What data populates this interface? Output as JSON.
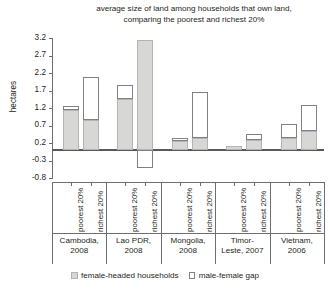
{
  "chart_data": {
    "type": "bar",
    "title": "average size of land among households that own land, comparing the poorest and richest 20%",
    "title_line1": "average size of land among households that own land,",
    "title_line2": "comparing the poorest and richest 20%",
    "xlabel": "",
    "ylabel": "hectares",
    "ylim": [
      -0.8,
      3.2
    ],
    "ytick_step": 0.5,
    "yticks": [
      3.2,
      2.7,
      2.2,
      1.7,
      1.2,
      0.7,
      0.2,
      -0.3,
      -0.8
    ],
    "ytick_labels": [
      "3.2",
      "2.7",
      "2.2",
      "1.7",
      "1.2",
      "0.7",
      "0.2",
      "-0.3",
      "-0.8"
    ],
    "grid": false,
    "legend_position": "bottom",
    "legend": [
      {
        "label": "female-headed households",
        "swatch": "gray-filled",
        "color": "#d7d8d6"
      },
      {
        "label": "male-female gap",
        "swatch": "white-outline",
        "color": "#ffffff"
      }
    ],
    "groups": [
      {
        "name": "Cambodia,",
        "year": "2008"
      },
      {
        "name": "Lao PDR,",
        "year": "2008"
      },
      {
        "name": "Mongolia,",
        "year": "2008"
      },
      {
        "name": "Timor-",
        "year": "Leste, 2007"
      },
      {
        "name": "Vietnam,",
        "year": "2006"
      }
    ],
    "categories": [
      "poorest 20%",
      "richest 20%",
      "poorest 20%",
      "richest 20%",
      "poorest 20%",
      "richest 20%",
      "poorest 20%",
      "richest 20%",
      "poorest 20%",
      "richest 20%"
    ],
    "series": [
      {
        "name": "female-headed households",
        "values": [
          1.15,
          0.85,
          1.45,
          3.15,
          0.25,
          0.35,
          0.12,
          0.3,
          0.35,
          0.55
        ]
      },
      {
        "name": "male-female gap",
        "values": [
          0.12,
          1.25,
          0.4,
          -0.5,
          0.1,
          1.3,
          0.0,
          0.15,
          0.4,
          0.75
        ]
      }
    ],
    "bar_totals": [
      1.27,
      2.1,
      1.85,
      2.65,
      0.35,
      1.65,
      0.12,
      0.45,
      0.75,
      1.3
    ]
  },
  "legend": {
    "item1": "female-headed households",
    "item2": "male-female gap"
  }
}
